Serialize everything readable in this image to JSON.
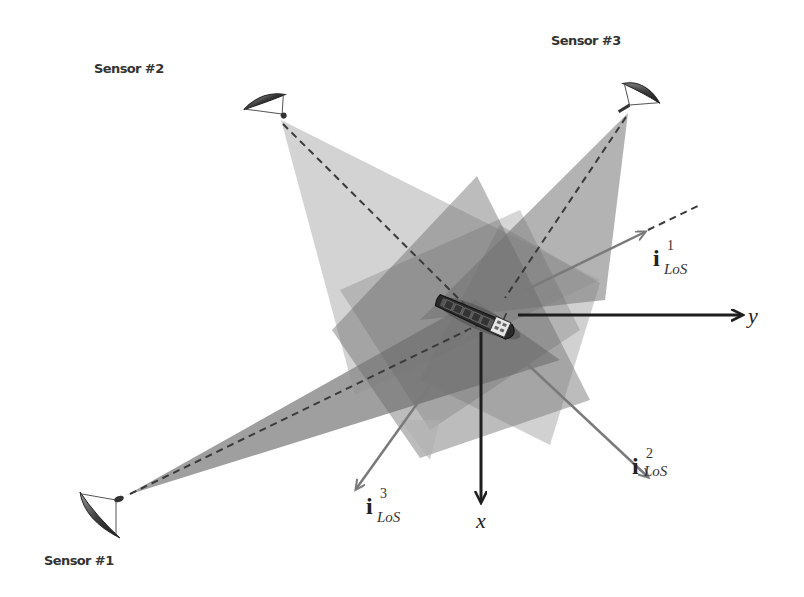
{
  "figure": {
    "sensors": [
      {
        "id": 1,
        "label": "Sensor #1"
      },
      {
        "id": 2,
        "label": "Sensor #2"
      },
      {
        "id": 3,
        "label": "Sensor #3"
      }
    ],
    "axes": {
      "x_label": "x",
      "y_label": "y"
    },
    "los_vectors": [
      {
        "symbol": "i",
        "superscript": "1",
        "subscript": "LoS"
      },
      {
        "symbol": "i",
        "superscript": "2",
        "subscript": "LoS"
      },
      {
        "symbol": "i",
        "superscript": "3",
        "subscript": "LoS"
      }
    ],
    "target": "ship-icon",
    "colors": {
      "beam_light": "#b8b8b8",
      "beam_mid": "#8a8a8a",
      "beam_dark": "#6e6e6e",
      "los_arrow": "#7a7a7a",
      "axis_arrow": "#1e1e1e",
      "dashed_line": "#3a3a3a"
    }
  }
}
